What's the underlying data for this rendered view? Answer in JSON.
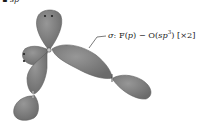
{
  "diagram": {
    "title_fragment": "sp",
    "annotation": {
      "sigma_symbol": "σ",
      "bond_text_prefix": ": F(",
      "bond_F_orbital": "p",
      "bond_mid": ") − O(",
      "bond_O_orbital": "sp",
      "bond_O_exponent": "3",
      "bond_suffix": ")",
      "multiplicity": "[×2]"
    },
    "atoms": [
      "O",
      "F",
      "F"
    ],
    "lone_pair_count_shown": 2,
    "colors": {
      "lobe_fill": "#7a7a7a",
      "lobe_edge": "#5e5e5e",
      "lobe_highlight": "#959595",
      "text": "#1a1a1a",
      "background": "#ffffff"
    }
  }
}
